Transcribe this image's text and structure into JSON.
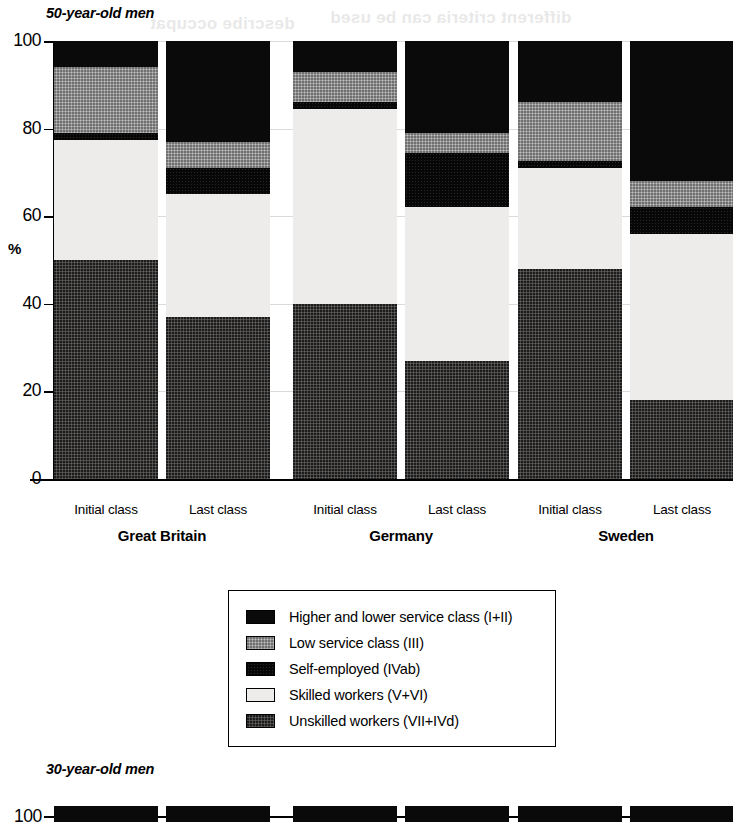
{
  "figure": {
    "panel_a_title": "50-year-old men",
    "panel_b_title": "30-year-old men",
    "y_axis_title": "%"
  },
  "legend": {
    "position": "below-plot",
    "items": [
      {
        "label": "Higher and lower service class (I+II)",
        "key": "service",
        "color": "#0a0a0a",
        "swatch": "solid-black"
      },
      {
        "label": "Low service class (III)",
        "key": "lowservice",
        "color": "#9b9b9b",
        "swatch": "medium-gray"
      },
      {
        "label": "Self-employed (IVab)",
        "key": "selfemp",
        "color": "#070707",
        "swatch": "solid-black"
      },
      {
        "label": "Skilled workers (V+VI)",
        "key": "skilled",
        "color": "#eeecea",
        "swatch": "very-light"
      },
      {
        "label": "Unskilled workers (VII+IVd)",
        "key": "unskilled",
        "color": "#4a4846",
        "swatch": "dark-gray"
      }
    ]
  },
  "chart_data": {
    "type": "bar",
    "subtype": "stacked-percent",
    "title": "50-year-old men",
    "xlabel": "",
    "ylabel": "%",
    "ylim": [
      0,
      100
    ],
    "yticks": [
      0,
      20,
      40,
      60,
      80,
      100
    ],
    "ytick_labels": [
      "0",
      "20",
      "40",
      "60",
      "80",
      "100"
    ],
    "grid": "faint-horizontal",
    "legend_position": "below",
    "groups": [
      "Great Britain",
      "Germany",
      "Sweden"
    ],
    "categories": [
      "Initial class",
      "Last class",
      "Initial class",
      "Last class",
      "Initial class",
      "Last class"
    ],
    "bars": [
      {
        "group": "Great Britain",
        "category": "Initial class",
        "segments": [
          {
            "name": "Unskilled workers (VII+IVd)",
            "key": "unskilled",
            "value": 50.0
          },
          {
            "name": "Skilled workers (V+VI)",
            "key": "skilled",
            "value": 27.5
          },
          {
            "name": "Self-employed (IVab)",
            "key": "selfemp",
            "value": 1.5
          },
          {
            "name": "Low service class (III)",
            "key": "lowservice",
            "value": 15.0
          },
          {
            "name": "Higher and lower service class (I+II)",
            "key": "service",
            "value": 6.0
          }
        ]
      },
      {
        "group": "Great Britain",
        "category": "Last class",
        "segments": [
          {
            "name": "Unskilled workers (VII+IVd)",
            "key": "unskilled",
            "value": 37.0
          },
          {
            "name": "Skilled workers (V+VI)",
            "key": "skilled",
            "value": 28.0
          },
          {
            "name": "Self-employed (IVab)",
            "key": "selfemp",
            "value": 6.0
          },
          {
            "name": "Low service class (III)",
            "key": "lowservice",
            "value": 6.0
          },
          {
            "name": "Higher and lower service class (I+II)",
            "key": "service",
            "value": 23.0
          }
        ]
      },
      {
        "group": "Germany",
        "category": "Initial class",
        "segments": [
          {
            "name": "Unskilled workers (VII+IVd)",
            "key": "unskilled",
            "value": 40.0
          },
          {
            "name": "Skilled workers (V+VI)",
            "key": "skilled",
            "value": 44.5
          },
          {
            "name": "Self-employed (IVab)",
            "key": "selfemp",
            "value": 1.5
          },
          {
            "name": "Low service class (III)",
            "key": "lowservice",
            "value": 7.0
          },
          {
            "name": "Higher and lower service class (I+II)",
            "key": "service",
            "value": 7.0
          }
        ]
      },
      {
        "group": "Germany",
        "category": "Last class",
        "segments": [
          {
            "name": "Unskilled workers (VII+IVd)",
            "key": "unskilled",
            "value": 27.0
          },
          {
            "name": "Skilled workers (V+VI)",
            "key": "skilled",
            "value": 35.0
          },
          {
            "name": "Self-employed (IVab)",
            "key": "selfemp",
            "value": 12.5
          },
          {
            "name": "Low service class (III)",
            "key": "lowservice",
            "value": 4.5
          },
          {
            "name": "Higher and lower service class (I+II)",
            "key": "service",
            "value": 21.0
          }
        ]
      },
      {
        "group": "Sweden",
        "category": "Initial class",
        "segments": [
          {
            "name": "Unskilled workers (VII+IVd)",
            "key": "unskilled",
            "value": 48.0
          },
          {
            "name": "Skilled workers (V+VI)",
            "key": "skilled",
            "value": 23.0
          },
          {
            "name": "Self-employed (IVab)",
            "key": "selfemp",
            "value": 1.5
          },
          {
            "name": "Low service class (III)",
            "key": "lowservice",
            "value": 13.5
          },
          {
            "name": "Higher and lower service class (I+II)",
            "key": "service",
            "value": 14.0
          }
        ]
      },
      {
        "group": "Sweden",
        "category": "Last class",
        "segments": [
          {
            "name": "Unskilled workers (VII+IVd)",
            "key": "unskilled",
            "value": 18.0
          },
          {
            "name": "Skilled workers (V+VI)",
            "key": "skilled",
            "value": 38.0
          },
          {
            "name": "Self-employed (IVab)",
            "key": "selfemp",
            "value": 6.0
          },
          {
            "name": "Low service class (III)",
            "key": "lowservice",
            "value": 6.0
          },
          {
            "name": "Higher and lower service class (I+II)",
            "key": "service",
            "value": 32.0
          }
        ]
      }
    ]
  },
  "panel_b": {
    "ytick_label_top": "100"
  }
}
